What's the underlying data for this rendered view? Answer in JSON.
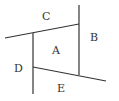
{
  "diagram": {
    "regions": [
      {
        "id": "A",
        "label": "A",
        "x": 56,
        "y": 54
      },
      {
        "id": "B",
        "label": "B",
        "x": 94,
        "y": 41
      },
      {
        "id": "C",
        "label": "C",
        "x": 46,
        "y": 20
      },
      {
        "id": "D",
        "label": "D",
        "x": 18,
        "y": 72
      },
      {
        "id": "E",
        "label": "E",
        "x": 61,
        "y": 92
      }
    ],
    "lines": [
      {
        "name": "top-line",
        "x1": 5,
        "y1": 38,
        "x2": 79,
        "y2": 24
      },
      {
        "name": "right-vertical",
        "x1": 79,
        "y1": 5,
        "x2": 79,
        "y2": 75
      },
      {
        "name": "left-vertical",
        "x1": 33,
        "y1": 33,
        "x2": 33,
        "y2": 94
      },
      {
        "name": "bottom-line",
        "x1": 33,
        "y1": 67,
        "x2": 106,
        "y2": 81
      }
    ],
    "line_color": "#333333"
  }
}
